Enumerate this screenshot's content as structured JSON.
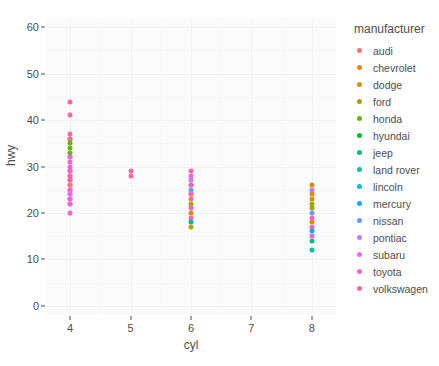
{
  "chart_data": {
    "type": "scatter",
    "title": "",
    "xlabel": "cyl",
    "ylabel": "hwy",
    "xlim": [
      3.6,
      8.4
    ],
    "ylim": [
      -2,
      62
    ],
    "x_ticks": [
      4,
      5,
      6,
      7,
      8
    ],
    "y_ticks": [
      0,
      10,
      20,
      30,
      40,
      50,
      60
    ],
    "grid": true,
    "legend_position": "right",
    "legend_title": "manufacturer",
    "color_key": "manufacturer",
    "categories": [
      "audi",
      "chevrolet",
      "dodge",
      "ford",
      "honda",
      "hyundai",
      "jeep",
      "land rover",
      "lincoln",
      "mercury",
      "nissan",
      "pontiac",
      "subaru",
      "toyota",
      "volkswagen"
    ],
    "colors": [
      "#F8766D",
      "#E58700",
      "#C99800",
      "#A3A500",
      "#6BB100",
      "#00BA38",
      "#00BF7D",
      "#00C0AF",
      "#00BCD8",
      "#00B0F6",
      "#619CFF",
      "#B983FF",
      "#E76BF3",
      "#FD61D1",
      "#FF67A4"
    ],
    "points": [
      {
        "x": 4,
        "y": 44,
        "m": "volkswagen"
      },
      {
        "x": 4,
        "y": 41,
        "m": "volkswagen"
      },
      {
        "x": 4,
        "y": 37,
        "m": "volkswagen"
      },
      {
        "x": 4,
        "y": 36,
        "m": "honda"
      },
      {
        "x": 4,
        "y": 36,
        "m": "volkswagen"
      },
      {
        "x": 4,
        "y": 35,
        "m": "honda"
      },
      {
        "x": 4,
        "y": 34,
        "m": "honda"
      },
      {
        "x": 4,
        "y": 33,
        "m": "honda"
      },
      {
        "x": 4,
        "y": 32,
        "m": "nissan"
      },
      {
        "x": 4,
        "y": 32,
        "m": "toyota"
      },
      {
        "x": 4,
        "y": 31,
        "m": "toyota"
      },
      {
        "x": 4,
        "y": 30,
        "m": "toyota"
      },
      {
        "x": 4,
        "y": 29,
        "m": "volkswagen"
      },
      {
        "x": 4,
        "y": 29,
        "m": "toyota"
      },
      {
        "x": 4,
        "y": 28,
        "m": "toyota"
      },
      {
        "x": 4,
        "y": 28,
        "m": "volkswagen"
      },
      {
        "x": 4,
        "y": 27,
        "m": "toyota"
      },
      {
        "x": 4,
        "y": 27,
        "m": "volkswagen"
      },
      {
        "x": 4,
        "y": 26,
        "m": "toyota"
      },
      {
        "x": 4,
        "y": 26,
        "m": "audi"
      },
      {
        "x": 4,
        "y": 25,
        "m": "subaru"
      },
      {
        "x": 4,
        "y": 25,
        "m": "toyota"
      },
      {
        "x": 4,
        "y": 24,
        "m": "pontiac"
      },
      {
        "x": 4,
        "y": 24,
        "m": "subaru"
      },
      {
        "x": 4,
        "y": 23,
        "m": "subaru"
      },
      {
        "x": 4,
        "y": 23,
        "m": "toyota"
      },
      {
        "x": 4,
        "y": 22,
        "m": "nissan"
      },
      {
        "x": 4,
        "y": 22,
        "m": "toyota"
      },
      {
        "x": 4,
        "y": 20,
        "m": "toyota"
      },
      {
        "x": 5,
        "y": 29,
        "m": "volkswagen"
      },
      {
        "x": 5,
        "y": 28,
        "m": "volkswagen"
      },
      {
        "x": 6,
        "y": 29,
        "m": "volkswagen"
      },
      {
        "x": 6,
        "y": 28,
        "m": "toyota"
      },
      {
        "x": 6,
        "y": 27,
        "m": "pontiac"
      },
      {
        "x": 6,
        "y": 26,
        "m": "toyota"
      },
      {
        "x": 6,
        "y": 26,
        "m": "volkswagen"
      },
      {
        "x": 6,
        "y": 25,
        "m": "nissan"
      },
      {
        "x": 6,
        "y": 24,
        "m": "toyota"
      },
      {
        "x": 6,
        "y": 24,
        "m": "volkswagen"
      },
      {
        "x": 6,
        "y": 23,
        "m": "audi"
      },
      {
        "x": 6,
        "y": 22,
        "m": "ford"
      },
      {
        "x": 6,
        "y": 21,
        "m": "toyota"
      },
      {
        "x": 6,
        "y": 20,
        "m": "chevrolet"
      },
      {
        "x": 6,
        "y": 19,
        "m": "toyota"
      },
      {
        "x": 6,
        "y": 18,
        "m": "jeep"
      },
      {
        "x": 6,
        "y": 17,
        "m": "dodge"
      },
      {
        "x": 8,
        "y": 26,
        "m": "chevrolet"
      },
      {
        "x": 8,
        "y": 25,
        "m": "pontiac"
      },
      {
        "x": 8,
        "y": 24,
        "m": "chevrolet"
      },
      {
        "x": 8,
        "y": 23,
        "m": "dodge"
      },
      {
        "x": 8,
        "y": 22,
        "m": "ford"
      },
      {
        "x": 8,
        "y": 21,
        "m": "ford"
      },
      {
        "x": 8,
        "y": 20,
        "m": "nissan"
      },
      {
        "x": 8,
        "y": 19,
        "m": "toyota"
      },
      {
        "x": 8,
        "y": 18,
        "m": "chevrolet"
      },
      {
        "x": 8,
        "y": 17,
        "m": "toyota"
      },
      {
        "x": 8,
        "y": 16,
        "m": "mercury"
      },
      {
        "x": 8,
        "y": 15,
        "m": "toyota"
      },
      {
        "x": 8,
        "y": 14,
        "m": "jeep"
      },
      {
        "x": 8,
        "y": 12,
        "m": "land rover"
      }
    ]
  }
}
